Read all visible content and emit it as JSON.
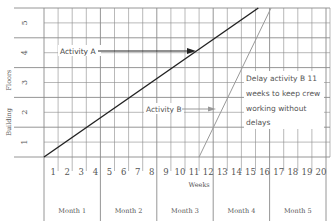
{
  "chart_data": {
    "type": "line",
    "title": "",
    "xlabel": "Weeks",
    "ylabel": "Building Floors",
    "x_ticks": [
      "1",
      "2",
      "3",
      "4",
      "5",
      "6",
      "7",
      "8",
      "9",
      "10",
      "11",
      "12",
      "13",
      "14",
      "15",
      "16",
      "17",
      "18",
      "19",
      "20"
    ],
    "y_ticks": [
      "1",
      "2",
      "3",
      "4",
      "5"
    ],
    "xlim": [
      0,
      20.3
    ],
    "ylim": [
      0,
      5
    ],
    "grid": true,
    "month_bands": [
      {
        "label": "Month 1",
        "start": 0,
        "end": 4
      },
      {
        "label": "Month 2",
        "start": 4,
        "end": 8
      },
      {
        "label": "Month 3",
        "start": 8,
        "end": 12
      },
      {
        "label": "Month 4",
        "start": 12,
        "end": 16
      },
      {
        "label": "Month 5",
        "start": 16,
        "end": 20
      }
    ],
    "series": [
      {
        "name": "Activity A",
        "color": "#222222",
        "points": [
          [
            0,
            0
          ],
          [
            15.2,
            5
          ]
        ]
      },
      {
        "name": "Activity B",
        "color": "#999999",
        "points": [
          [
            11,
            0
          ],
          [
            16.1,
            5
          ]
        ]
      }
    ],
    "annotations": [
      {
        "text": "Activity A",
        "arrow_to_series": "Activity A"
      },
      {
        "text": "Activity B",
        "arrow_to_series": "Activity B"
      },
      {
        "text": "Delay activity B 11 weeks to keep crew working without delays",
        "lines": [
          "Delay activity B 11",
          "weeks to keep crew",
          "working without",
          "delays"
        ]
      }
    ]
  },
  "labels": {
    "x_axis": "Weeks",
    "y_axis": "Building",
    "y_axis2": "Floors",
    "activity_a": "Activity A",
    "activity_b": "Activity B",
    "note": [
      "Delay activity B 11",
      "weeks to keep crew",
      "working without",
      "delays"
    ],
    "months": [
      "Month 1",
      "Month 2",
      "Month 3",
      "Month 4",
      "Month 5"
    ],
    "weeks": [
      "1",
      "2",
      "3",
      "4",
      "5",
      "6",
      "7",
      "8",
      "9",
      "10",
      "11",
      "12",
      "13",
      "14",
      "15",
      "16",
      "17",
      "18",
      "19",
      "20"
    ],
    "floors": [
      "1",
      "2",
      "3",
      "4",
      "5"
    ]
  },
  "colors": {
    "grid": "#8a8a8a",
    "activity_a": "#222222",
    "activity_b": "#9a9a9a",
    "text": "#555555"
  }
}
